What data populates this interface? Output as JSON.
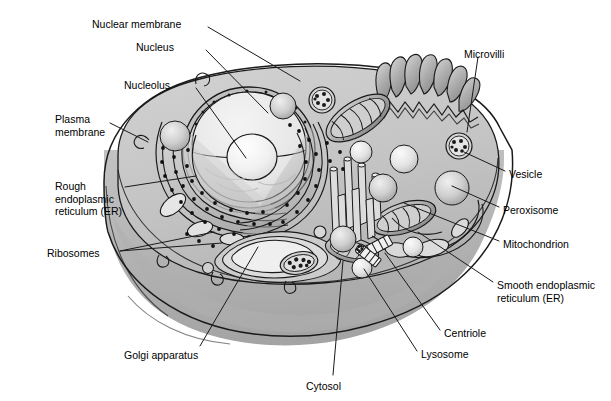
{
  "diagram": {
    "type": "labeled-biological-diagram",
    "style": "grayscale cutaway illustration"
  },
  "colors": {
    "background": "#ffffff",
    "outline": "#1a1a1a",
    "cytosol_top": "#c9c9c9",
    "cytosol_front": "#b4b4b4",
    "cytosol_side": "#a8a8a8",
    "nucleus_fill": "#e8e8e8",
    "nucleolus_fill": "#f2f2f2",
    "organelle_mid": "#9a9a9a",
    "organelle_light": "#d5d5d5",
    "ribosome": "#111111",
    "leader_line": "#1a1a1a"
  },
  "labels": [
    {
      "id": "nuclear-membrane",
      "text": "Nuclear membrane",
      "x": 92,
      "y": 18,
      "align": "left"
    },
    {
      "id": "nucleus",
      "text": "Nucleus",
      "x": 136,
      "y": 41,
      "align": "left"
    },
    {
      "id": "nucleolus",
      "text": "Nucleolus",
      "x": 124,
      "y": 79,
      "align": "left"
    },
    {
      "id": "plasma-membrane",
      "text": "Plasma\nmembrane",
      "x": 55,
      "y": 113,
      "align": "left"
    },
    {
      "id": "rough-er",
      "text": "Rough\nendoplasmic\nreticulum (ER)",
      "x": 55,
      "y": 180,
      "align": "left"
    },
    {
      "id": "ribosomes",
      "text": "Ribosomes",
      "x": 47,
      "y": 247,
      "align": "left"
    },
    {
      "id": "microvilli",
      "text": "Microvilli",
      "x": 464,
      "y": 48,
      "align": "left"
    },
    {
      "id": "vesicle",
      "text": "Vesicle",
      "x": 509,
      "y": 168,
      "align": "left"
    },
    {
      "id": "peroxisome",
      "text": "Peroxisome",
      "x": 503,
      "y": 204,
      "align": "left"
    },
    {
      "id": "mitochondrion",
      "text": "Mitochondrion",
      "x": 503,
      "y": 238,
      "align": "left"
    },
    {
      "id": "smooth-er",
      "text": "Smooth endoplasmic\nreticulum (ER)",
      "x": 497,
      "y": 279,
      "align": "left"
    },
    {
      "id": "centriole",
      "text": "Centriole",
      "x": 444,
      "y": 327,
      "align": "left"
    },
    {
      "id": "lysosome",
      "text": "Lysosome",
      "x": 421,
      "y": 348,
      "align": "left"
    },
    {
      "id": "cytosol",
      "text": "Cytosol",
      "x": 306,
      "y": 380,
      "align": "left"
    },
    {
      "id": "golgi-apparatus",
      "text": "Golgi apparatus",
      "x": 124,
      "y": 349,
      "align": "left"
    }
  ],
  "leaders": [
    {
      "id": "leader-nuclear-membrane",
      "points": "208,27 300,81"
    },
    {
      "id": "leader-nucleus",
      "points": "206,50 268,113"
    },
    {
      "id": "leader-nucleolus",
      "points": "196,88 246,158"
    },
    {
      "id": "leader-plasma-membrane",
      "points": "110,123 148,142"
    },
    {
      "id": "leader-rough-er",
      "points": "125,187 196,176"
    },
    {
      "id": "leader-ribosomes-a",
      "points": "120,251 214,232"
    },
    {
      "id": "leader-ribosomes-b",
      "points": "120,251 222,243"
    },
    {
      "id": "leader-microvilli",
      "points": "478,57 467,132"
    },
    {
      "id": "leader-vesicle",
      "points": "505,171 464,152"
    },
    {
      "id": "leader-peroxisome",
      "points": "499,207 452,186"
    },
    {
      "id": "leader-mitochondrion",
      "points": "499,241 404,203"
    },
    {
      "id": "leader-smooth-er",
      "points": "493,282 418,232"
    },
    {
      "id": "leader-centriole",
      "points": "440,330 385,253"
    },
    {
      "id": "leader-lysosome",
      "points": "417,351 364,269"
    },
    {
      "id": "leader-cytosol",
      "points": "333,375 343,261"
    },
    {
      "id": "leader-golgi",
      "points": "200,346 258,247"
    }
  ],
  "organelles": [
    {
      "id": "nucleus",
      "name": "nucleus"
    },
    {
      "id": "nucleolus",
      "name": "nucleolus"
    },
    {
      "id": "nuclear-envelope",
      "name": "nuclear-membrane"
    },
    {
      "id": "rough-er",
      "name": "rough-endoplasmic-reticulum"
    },
    {
      "id": "ribosome-dots",
      "name": "ribosomes"
    },
    {
      "id": "golgi",
      "name": "golgi-apparatus"
    },
    {
      "id": "microvilli",
      "name": "microvilli"
    },
    {
      "id": "mitochondria",
      "name": "mitochondrion"
    },
    {
      "id": "smooth-er",
      "name": "smooth-endoplasmic-reticulum"
    },
    {
      "id": "centrioles",
      "name": "centriole"
    },
    {
      "id": "lysosomes",
      "name": "lysosome"
    },
    {
      "id": "peroxisomes",
      "name": "peroxisome"
    },
    {
      "id": "vesicles",
      "name": "vesicle"
    },
    {
      "id": "cytoskeleton",
      "name": "cytoskeleton"
    },
    {
      "id": "plasma-membrane",
      "name": "plasma-membrane"
    },
    {
      "id": "cytosol",
      "name": "cytosol"
    }
  ]
}
